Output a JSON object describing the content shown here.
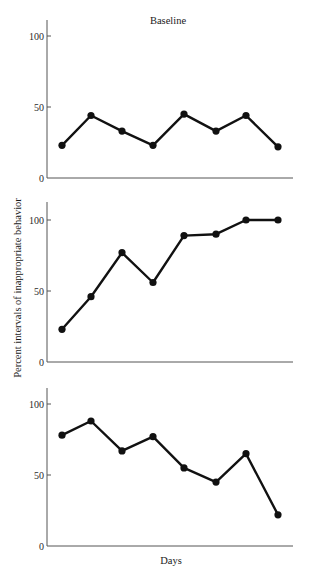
{
  "chart_data": {
    "type": "line",
    "title": "",
    "xlabel": "Days",
    "ylabel": "Percent intervals of inappropriate behavior",
    "legend": null,
    "grid": false,
    "panels": [
      {
        "title": "Baseline",
        "x": [
          1,
          2,
          3,
          4,
          5,
          6,
          7,
          8
        ],
        "values": [
          23,
          44,
          33,
          23,
          45,
          33,
          44,
          22
        ],
        "ylim": [
          0,
          110
        ],
        "yticks": [
          0,
          50,
          100
        ],
        "ytick_labels": [
          "0",
          "50",
          "100"
        ]
      },
      {
        "title": "",
        "x": [
          1,
          2,
          3,
          4,
          5,
          6,
          7,
          8
        ],
        "values": [
          23,
          46,
          77,
          56,
          89,
          90,
          100,
          100
        ],
        "ylim": [
          0,
          110
        ],
        "yticks": [
          0,
          50,
          100
        ],
        "ytick_labels": [
          "0",
          "50",
          "100"
        ]
      },
      {
        "title": "",
        "x": [
          1,
          2,
          3,
          4,
          5,
          6,
          7,
          8
        ],
        "values": [
          78,
          88,
          67,
          77,
          55,
          45,
          65,
          22
        ],
        "ylim": [
          0,
          110
        ],
        "yticks": [
          0,
          50,
          100
        ],
        "ytick_labels": [
          "0",
          "50",
          "100"
        ]
      }
    ]
  },
  "layout": {
    "axis_x": 47,
    "axis_x_end": 293,
    "point_x": [
      62,
      91,
      122,
      153,
      184,
      216,
      246,
      278
    ],
    "panels": [
      {
        "y_zero": 178,
        "y_hundred": 36,
        "axis_top": 20,
        "title_x": 168,
        "title_y": 24
      },
      {
        "y_zero": 362,
        "y_hundred": 220,
        "axis_top": 202
      },
      {
        "y_zero": 546,
        "y_hundred": 404,
        "axis_top": 388
      }
    ],
    "xlabel_pos": {
      "x": 171,
      "y": 564
    },
    "ylabel_pos": {
      "x": 21,
      "y": 288
    }
  },
  "colors": {
    "line": "#111111",
    "axis": "#555555",
    "background": "#ffffff"
  }
}
